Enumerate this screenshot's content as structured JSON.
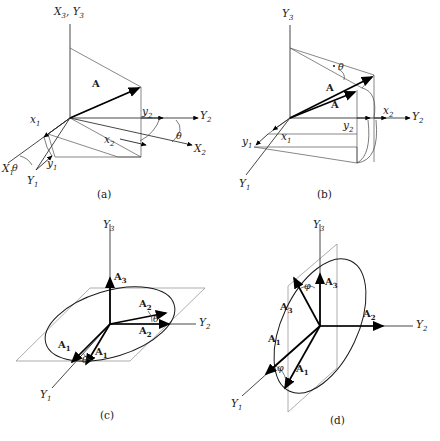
{
  "figure": {
    "background_color": "#ffffff",
    "line_color": "#222222",
    "plane_color": "#8a8a8a",
    "vector_color": "#000000"
  },
  "panels": [
    {
      "id": "a",
      "caption": "(a)",
      "axes": [
        {
          "name": "X3Y3",
          "label_main": "X",
          "label_sub": "3,",
          "label_main2": "Y",
          "label_sub2": "3",
          "text": "X3, Y3"
        },
        {
          "name": "Y2",
          "label_main": "Y",
          "label_sub": "2"
        },
        {
          "name": "X2",
          "label_main": "X",
          "label_sub": "2"
        },
        {
          "name": "X1",
          "label_main": "X",
          "label_sub": "1"
        },
        {
          "name": "Y1",
          "label_main": "Y",
          "label_sub": "1"
        }
      ],
      "components": [
        {
          "name": "x1",
          "label_main": "x",
          "label_sub": "1"
        },
        {
          "name": "y1",
          "label_main": "y",
          "label_sub": "1"
        },
        {
          "name": "x2",
          "label_main": "x",
          "label_sub": "2"
        },
        {
          "name": "y2",
          "label_main": "y",
          "label_sub": "2"
        }
      ],
      "vector_label": "A",
      "angle_labels": [
        "θ",
        "θ"
      ]
    },
    {
      "id": "b",
      "caption": "(b)",
      "axes": [
        {
          "name": "Y3",
          "label_main": "Y",
          "label_sub": "3"
        },
        {
          "name": "Y2",
          "label_main": "Y",
          "label_sub": "2"
        },
        {
          "name": "Y1",
          "label_main": "Y",
          "label_sub": "1"
        }
      ],
      "components": [
        {
          "name": "x1",
          "label_main": "x",
          "label_sub": "1"
        },
        {
          "name": "y1",
          "label_main": "y",
          "label_sub": "1"
        },
        {
          "name": "x2",
          "label_main": "x",
          "label_sub": "2"
        },
        {
          "name": "y2",
          "label_main": "y",
          "label_sub": "2"
        }
      ],
      "vector_labels": [
        "A",
        "A"
      ],
      "angle_labels": [
        "θ"
      ]
    },
    {
      "id": "c",
      "caption": "(c)",
      "axes": [
        {
          "name": "Y3",
          "label_main": "Y",
          "label_sub": "3"
        },
        {
          "name": "Y2",
          "label_main": "Y",
          "label_sub": "2"
        },
        {
          "name": "Y1",
          "label_main": "Y",
          "label_sub": "1"
        }
      ],
      "vectors": [
        {
          "name": "A3",
          "label_main": "A",
          "label_sub": "3"
        },
        {
          "name": "A2",
          "label_main": "A",
          "label_sub": "2"
        },
        {
          "name": "A2b",
          "label_main": "A",
          "label_sub": "2"
        },
        {
          "name": "A1",
          "label_main": "A",
          "label_sub": "1"
        },
        {
          "name": "A1b",
          "label_main": "A",
          "label_sub": "1"
        }
      ],
      "angle_labels": [
        "θ",
        "θ"
      ],
      "plane": "horizontal"
    },
    {
      "id": "d",
      "caption": "(d)",
      "axes": [
        {
          "name": "Y3",
          "label_main": "Y",
          "label_sub": "3"
        },
        {
          "name": "Y2",
          "label_main": "Y",
          "label_sub": "2"
        },
        {
          "name": "Y1",
          "label_main": "Y",
          "label_sub": "1"
        }
      ],
      "vectors": [
        {
          "name": "A3",
          "label_main": "A",
          "label_sub": "3"
        },
        {
          "name": "A3b",
          "label_main": "A",
          "label_sub": "3"
        },
        {
          "name": "A2",
          "label_main": "A",
          "label_sub": "2"
        },
        {
          "name": "A1",
          "label_main": "A",
          "label_sub": "1"
        },
        {
          "name": "A1b",
          "label_main": "A",
          "label_sub": "1"
        }
      ],
      "angle_labels": [
        "φ",
        "φ"
      ],
      "plane": "vertical"
    }
  ],
  "labels": {
    "a": {
      "axis_x3y3": "X3, Y3",
      "axis_y2": "Y2",
      "axis_x2": "X2",
      "axis_x1": "X1",
      "axis_y1": "Y1",
      "comp_x1": "x1",
      "comp_y1": "y1",
      "comp_x2": "x2",
      "comp_y2": "y2",
      "vector_a": "A",
      "theta_left": "θ",
      "theta_right": "θ",
      "caption": "(a)"
    },
    "b": {
      "axis_y3": "Y3",
      "axis_y2": "Y2",
      "axis_y1": "Y1",
      "comp_x1": "x1",
      "comp_y1": "y1",
      "comp_x2": "x2",
      "comp_y2": "y2",
      "vector_a1": "A",
      "vector_a2": "A",
      "theta": "θ",
      "caption": "(b)"
    },
    "c": {
      "axis_y3": "Y3",
      "axis_y2": "Y2",
      "axis_y1": "Y1",
      "vec_a3": "A3",
      "vec_a2_upper": "A2",
      "vec_a2_lower": "A2",
      "vec_a1_left": "A1",
      "vec_a1_right": "A1",
      "theta_right": "θ",
      "theta_left": "θ",
      "caption": "(c)"
    },
    "d": {
      "axis_y3": "Y3",
      "axis_y2": "Y2",
      "axis_y1": "Y1",
      "vec_a3_right": "A3",
      "vec_a3_left": "A3",
      "vec_a2": "A2",
      "vec_a1_upper": "A1",
      "vec_a1_lower": "A1",
      "phi_upper": "φ",
      "phi_lower": "φ",
      "caption": "(d)"
    }
  }
}
